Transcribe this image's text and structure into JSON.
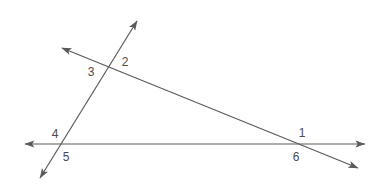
{
  "figure": {
    "width": 382,
    "height": 189,
    "background_color": "#ffffff",
    "stroke_color": "#5a5a5a",
    "label_color": "#4a4a4a",
    "stroke_width": 1.2
  },
  "lines": [
    {
      "id": "transversal-line",
      "name": "line-through-angles-3-2-1-6",
      "from": {
        "x": 62,
        "y": 48
      },
      "to": {
        "x": 358,
        "y": 168
      },
      "arrow_start": true,
      "arrow_end": true
    },
    {
      "id": "steep-line",
      "name": "line-through-angles-2-3-4-5",
      "from": {
        "x": 137,
        "y": 21
      },
      "to": {
        "x": 40,
        "y": 178
      },
      "arrow_start": true,
      "arrow_end": true
    },
    {
      "id": "horizontal-line",
      "name": "line-through-angles-4-5-1-6",
      "from": {
        "x": 25,
        "y": 144
      },
      "to": {
        "x": 365,
        "y": 144
      },
      "arrow_start": true,
      "arrow_end": true
    }
  ],
  "intersections": [
    {
      "id": "upper-vertex",
      "x": 108,
      "y": 60,
      "labels": [
        "3",
        "2"
      ]
    },
    {
      "id": "left-vertex",
      "x": 61,
      "y": 144,
      "labels": [
        "4",
        "5"
      ]
    },
    {
      "id": "right-vertex",
      "x": 297,
      "y": 144,
      "labels": [
        "1",
        "6"
      ]
    }
  ],
  "labels": [
    {
      "id": "label-1",
      "text": "1",
      "x": 302,
      "y": 133
    },
    {
      "id": "label-2",
      "text": "2",
      "x": 125,
      "y": 62
    },
    {
      "id": "label-3",
      "text": "3",
      "x": 91,
      "y": 72
    },
    {
      "id": "label-4",
      "text": "4",
      "x": 55,
      "y": 134
    },
    {
      "id": "label-5",
      "text": "5",
      "x": 66,
      "y": 157
    },
    {
      "id": "label-6",
      "text": "6",
      "x": 296,
      "y": 157
    }
  ]
}
